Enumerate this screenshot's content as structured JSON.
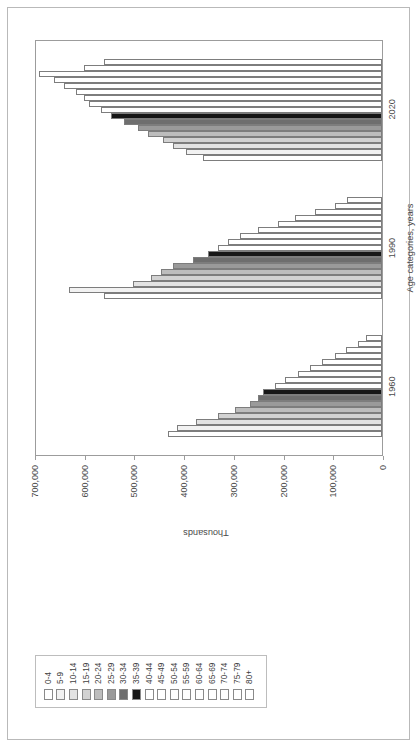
{
  "chart_data": {
    "type": "bar",
    "orientation": "rotated-90",
    "title": "",
    "xlabel": "Age categories, years",
    "ylabel": "Thousands",
    "categories": [
      "1960",
      "1990",
      "2020"
    ],
    "ylim": [
      0,
      700000
    ],
    "yticks": [
      0,
      100000,
      200000,
      300000,
      400000,
      500000,
      600000,
      700000
    ],
    "ytick_labels": [
      "0",
      "100,000",
      "200,000",
      "300,000",
      "400,000",
      "500,000",
      "600,000",
      "700,000"
    ],
    "grid": false,
    "legend_position": "top-left",
    "series": [
      {
        "name": "0-4",
        "pattern": "solid",
        "color": "#ffffff",
        "values": [
          430000,
          560000,
          360000
        ]
      },
      {
        "name": "5-9",
        "pattern": "solid",
        "color": "#f2f2f2",
        "values": [
          413000,
          630000,
          395000
        ]
      },
      {
        "name": "10-14",
        "pattern": "solid",
        "color": "#e3e3e3",
        "values": [
          375000,
          500000,
          420000
        ]
      },
      {
        "name": "15-19",
        "pattern": "solid",
        "color": "#d2d2d2",
        "values": [
          330000,
          465000,
          440000
        ]
      },
      {
        "name": "20-24",
        "pattern": "solid",
        "color": "#bdbdbd",
        "values": [
          295000,
          445000,
          470000
        ]
      },
      {
        "name": "25-29",
        "pattern": "solid",
        "color": "#9a9a9a",
        "values": [
          265000,
          420000,
          490000
        ]
      },
      {
        "name": "30-34",
        "pattern": "solid",
        "color": "#6e6e6e",
        "values": [
          250000,
          380000,
          520000
        ]
      },
      {
        "name": "35-39",
        "pattern": "solid",
        "color": "#171717",
        "values": [
          240000,
          350000,
          545000
        ]
      },
      {
        "name": "40-44",
        "pattern": "check",
        "color": "#ffffff",
        "values": [
          215000,
          330000,
          565000
        ]
      },
      {
        "name": "45-49",
        "pattern": "dhatch-l",
        "color": "#ffffff",
        "values": [
          195000,
          310000,
          590000
        ]
      },
      {
        "name": "50-54",
        "pattern": "dhatch-r",
        "color": "#ffffff",
        "values": [
          170000,
          285000,
          600000
        ]
      },
      {
        "name": "55-59",
        "pattern": "cross",
        "color": "#ffffff",
        "values": [
          145000,
          250000,
          615000
        ]
      },
      {
        "name": "60-64",
        "pattern": "vert",
        "color": "#ffffff",
        "values": [
          120000,
          210000,
          640000
        ]
      },
      {
        "name": "65-69",
        "pattern": "horz",
        "color": "#ffffff",
        "values": [
          95000,
          175000,
          660000
        ]
      },
      {
        "name": "70-74",
        "pattern": "grid",
        "color": "#ffffff",
        "values": [
          72000,
          135000,
          690000
        ]
      },
      {
        "name": "75-79",
        "pattern": "dhatch-w",
        "color": "#ffffff",
        "values": [
          48000,
          95000,
          600000
        ]
      },
      {
        "name": "80+",
        "pattern": "dhatch-r",
        "color": "#ffffff",
        "values": [
          32000,
          70000,
          560000
        ]
      }
    ]
  }
}
